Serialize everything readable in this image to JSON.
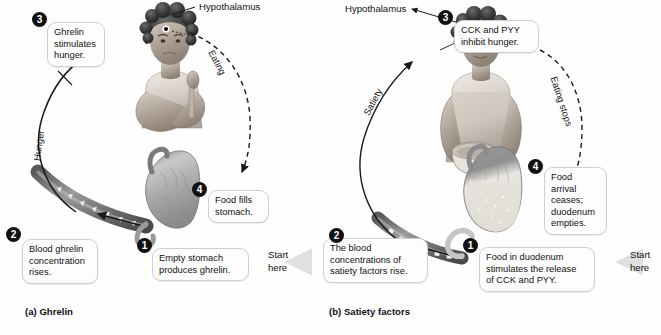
{
  "figure": {
    "panels": [
      {
        "id": "a",
        "caption": "(a) Ghrelin",
        "organ_label": "Hypothalamus",
        "cycle_labels": {
          "left": "Hunger",
          "right": "Eating"
        },
        "start_label": "Start\nhere",
        "steps": [
          {
            "number": "1",
            "text": "Empty stomach\nproduces ghrelin."
          },
          {
            "number": "2",
            "text": "Blood ghrelin\nconcentration\nrises."
          },
          {
            "number": "3",
            "text": "Ghrelin\nstimulates\nhunger."
          },
          {
            "number": "4",
            "text": "Food fills\nstomach."
          }
        ]
      },
      {
        "id": "b",
        "caption": "(b) Satiety factors",
        "organ_label": "Hypothalamus",
        "cycle_labels": {
          "left": "Satiety",
          "right": "Eating stops"
        },
        "start_label": "Start\nhere",
        "steps": [
          {
            "number": "1",
            "text": "Food in duodenum\nstimulates the release\nof CCK and PYY."
          },
          {
            "number": "2",
            "text": "The blood\nconcentrations of\nsatiety factors rise."
          },
          {
            "number": "3",
            "text": "CCK and PYY\ninhibit hunger."
          },
          {
            "number": "4",
            "text": "Food arrival\nceases;\nduodenum\nempties."
          }
        ]
      }
    ],
    "colors": {
      "badge_fill": "#111111",
      "badge_text": "#ffffff",
      "callout_border": "#cfcfcf",
      "callout_fill": "#fdfdfd",
      "arrow_stroke": "#1a1a1a",
      "page_background": "#fefefe",
      "start_arrow": "#e2e2e2"
    }
  }
}
